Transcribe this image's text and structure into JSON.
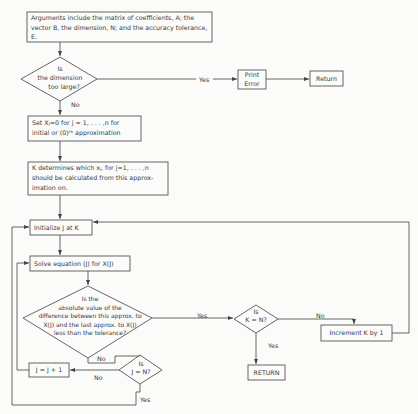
{
  "header": {
    "text": "FLOW CHART"
  },
  "nodes": {
    "arguments": {
      "text": "Arguments include the matrix of coefficients, A; the vector B, the dimension, N; and the accuracy tolerance, E."
    },
    "dim_check": {
      "line1": "Is",
      "line2": "the dimension",
      "line3": "too large?"
    },
    "print_error": {
      "line1": "Print",
      "line2": "Error"
    },
    "return_top": {
      "text": "Return"
    },
    "set_x": {
      "line1": "Set Xⱼ=0 for j = 1, . . . ,n for",
      "line2": "initial or (0)ᵗʰ  approximation"
    },
    "k_determines": {
      "line1": "K determines which xⱼ, for j=1, . . . ,n",
      "line2": "should be calculated from this approx-",
      "line3": "imation on."
    },
    "init_j": {
      "text": "Initialize J at K"
    },
    "solve": {
      "text": "Solve equation (J) for X(J)"
    },
    "tolerance_check": {
      "line1": "Is the",
      "line2": "absolute value of the",
      "line3": "difference between this approx. to",
      "line4": "X(J) and the last approx. to X(J)",
      "line5": "less than the tolerance?"
    },
    "k_eq_n": {
      "line1": "Is",
      "line2": "K = N?"
    },
    "increment_k": {
      "text": "Increment K by 1"
    },
    "return_bottom": {
      "text": "RETURN"
    },
    "j_plus_1": {
      "text": "J = J + 1"
    },
    "j_eq_n": {
      "line1": "Is",
      "line2": "J = N?"
    }
  },
  "edge_labels": {
    "dim_yes": "Yes",
    "dim_no": "No",
    "tol_yes": "Yes",
    "tol_no": "No",
    "kn_no": "No",
    "kn_yes": "Yes",
    "jn_no": "No",
    "jn_yes": "Yes"
  },
  "colors": {
    "line": "#555555",
    "text": "#3a3a3a",
    "background": "#fbfbfa"
  }
}
